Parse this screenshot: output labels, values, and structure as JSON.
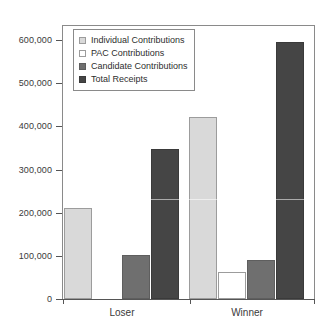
{
  "chart_data": {
    "type": "bar",
    "title": "",
    "subtitle": "",
    "xlabel": "",
    "ylabel": "",
    "categories": [
      "Loser",
      "Winner"
    ],
    "ylim": [
      0,
      600000
    ],
    "yticks": [
      0,
      100000,
      200000,
      300000,
      400000,
      500000,
      600000
    ],
    "ytick_labels": [
      "0",
      "100,000",
      "200,000",
      "300,000",
      "400,000",
      "500,000",
      "600,000"
    ],
    "grid": false,
    "legend_position": "top-left inside plot",
    "series": [
      {
        "name": "Individual Contributions",
        "color": "#d9d9d9",
        "values": [
          210000,
          422000
        ]
      },
      {
        "name": "PAC Contributions",
        "color": "#ffffff",
        "values": [
          0,
          62000
        ]
      },
      {
        "name": "Candidate Contributions",
        "color": "#6f6f6f",
        "values": [
          102000,
          90000
        ]
      },
      {
        "name": "Total Receipts",
        "color": "#454545",
        "values": [
          347000,
          595000
        ]
      }
    ]
  },
  "legend": {
    "entries": [
      {
        "label": "Individual Contributions",
        "swatch": "s-individual"
      },
      {
        "label": "PAC Contributions",
        "swatch": "s-pac"
      },
      {
        "label": "Candidate Contributions",
        "swatch": "s-candidate"
      },
      {
        "label": "Total Receipts",
        "swatch": "s-total"
      }
    ]
  },
  "axes": {
    "y_labels": [
      "600,000",
      "500,000",
      "400,000",
      "300,000",
      "200,000",
      "100,000",
      "0"
    ],
    "x_labels": [
      "Loser",
      "Winner"
    ]
  }
}
